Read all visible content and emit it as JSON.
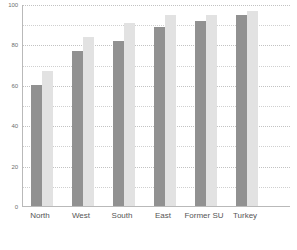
{
  "chart_data": {
    "type": "bar",
    "title": "",
    "subtitle": "",
    "xlabel": "",
    "ylabel": "",
    "categories": [
      "North",
      "West",
      "South",
      "East",
      "Former SU",
      "Turkey"
    ],
    "series": [
      {
        "name": "series-1",
        "color": "#919191",
        "values": [
          60,
          77,
          82,
          89,
          92,
          95
        ]
      },
      {
        "name": "series-2",
        "color": "#e2e2e2",
        "values": [
          67,
          84,
          91,
          95,
          95,
          97
        ]
      }
    ],
    "ylim": [
      0,
      100
    ],
    "yticks": [
      0,
      20,
      40,
      60,
      80,
      100
    ],
    "ytick_labels": [
      "0",
      "20",
      "40",
      "60",
      "80",
      "100"
    ],
    "minor_gridlines": [
      10,
      30,
      50,
      70,
      90
    ],
    "grid": true,
    "grid_style": "dotted",
    "legend": "none",
    "legend_position": "none",
    "annotations": []
  },
  "axis": {
    "line_color": "#b9b9b9",
    "grid_color": "#cfcfcf"
  }
}
